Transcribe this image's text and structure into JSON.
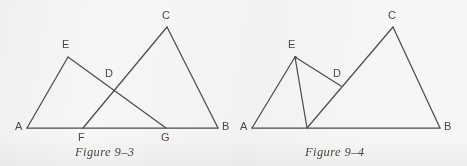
{
  "page": {
    "background_color": "#f7f6f4",
    "ink_color": "#4f4d4b",
    "width": 467,
    "height": 166
  },
  "figures": [
    {
      "id": "figure-9-3",
      "caption": "Figure 9–3",
      "caption_pos": {
        "x": 75,
        "y": 145
      },
      "description": "Two overlapping triangles AEG and FCB sharing base AB, crossing at D",
      "points": [
        {
          "name": "A",
          "x": 27,
          "y": 128,
          "label": "A",
          "label_x": 15,
          "label_y": 121,
          "show_dot": false
        },
        {
          "name": "E",
          "x": 68,
          "y": 57,
          "label": "E",
          "label_x": 62,
          "label_y": 39,
          "show_dot": false
        },
        {
          "name": "D",
          "x": 113,
          "y": 86,
          "label": "D",
          "label_x": 105,
          "label_y": 68,
          "show_dot": false
        },
        {
          "name": "C",
          "x": 167,
          "y": 27,
          "label": "C",
          "label_x": 162,
          "label_y": 10,
          "show_dot": false
        },
        {
          "name": "F",
          "x": 83,
          "y": 128,
          "label": "F",
          "label_x": 78,
          "label_y": 132,
          "show_dot": false
        },
        {
          "name": "G",
          "x": 166,
          "y": 128,
          "label": "G",
          "label_x": 161,
          "label_y": 132,
          "show_dot": false
        },
        {
          "name": "B",
          "x": 218,
          "y": 128,
          "label": "B",
          "label_x": 222,
          "label_y": 121,
          "show_dot": false
        }
      ],
      "segments": [
        {
          "name": "segment-AB",
          "from": "A",
          "to": "B"
        },
        {
          "name": "segment-AE",
          "from": "A",
          "to": "E"
        },
        {
          "name": "segment-EG",
          "from": "E",
          "to": "G"
        },
        {
          "name": "segment-FC",
          "from": "F",
          "to": "C"
        },
        {
          "name": "segment-CB",
          "from": "C",
          "to": "B"
        }
      ]
    },
    {
      "id": "figure-9-4",
      "caption": "Figure 9–4",
      "caption_pos": {
        "x": 305,
        "y": 145
      },
      "description": "Triangle AEH with cevian to base, segment ED, and triangle HCB sharing base AB",
      "points": [
        {
          "name": "A",
          "x": 252,
          "y": 128,
          "label": "A",
          "label_x": 240,
          "label_y": 121,
          "show_dot": false
        },
        {
          "name": "E",
          "x": 295,
          "y": 57,
          "label": "E",
          "label_x": 288,
          "label_y": 39,
          "show_dot": true
        },
        {
          "name": "D",
          "x": 341,
          "y": 86,
          "label": "D",
          "label_x": 333,
          "label_y": 68,
          "show_dot": false
        },
        {
          "name": "C",
          "x": 393,
          "y": 27,
          "label": "C",
          "label_x": 388,
          "label_y": 10,
          "show_dot": false
        },
        {
          "name": "H",
          "x": 307,
          "y": 128,
          "label": "",
          "label_x": 0,
          "label_y": 0,
          "show_dot": false
        },
        {
          "name": "B",
          "x": 440,
          "y": 128,
          "label": "B",
          "label_x": 444,
          "label_y": 121,
          "show_dot": false
        }
      ],
      "segments": [
        {
          "name": "segment-AB",
          "from": "A",
          "to": "B"
        },
        {
          "name": "segment-AE",
          "from": "A",
          "to": "E"
        },
        {
          "name": "segment-EH",
          "from": "E",
          "to": "H"
        },
        {
          "name": "segment-ED",
          "from": "E",
          "to": "D"
        },
        {
          "name": "segment-HC",
          "from": "H",
          "to": "C"
        },
        {
          "name": "segment-CB",
          "from": "C",
          "to": "B"
        }
      ]
    }
  ]
}
